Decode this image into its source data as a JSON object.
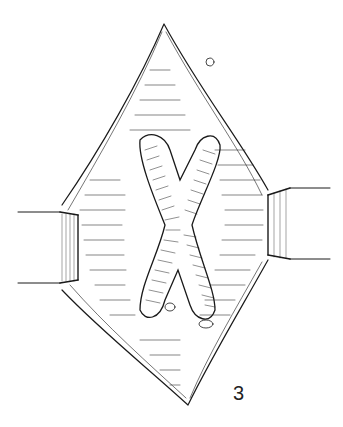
{
  "figure": {
    "label": "3"
  },
  "colors": {
    "ink": "#1a1a1a",
    "paper": "#ffffff"
  }
}
